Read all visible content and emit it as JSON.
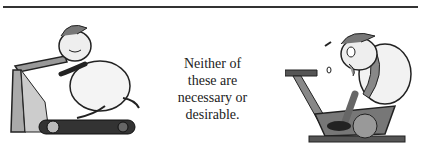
{
  "caption": {
    "lines": [
      "Neither of",
      "these are",
      "necessary or",
      "desirable."
    ]
  },
  "illustrations": {
    "left": "cartoon-man-on-treadmill",
    "right": "cartoon-exhausted-man-on-exercise-bike"
  },
  "colors": {
    "ink": "#222222",
    "shade": "#888888",
    "rule": "#333333"
  }
}
